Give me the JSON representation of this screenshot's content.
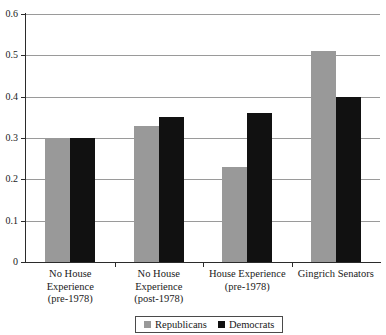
{
  "chart_data": {
    "type": "bar",
    "title": "",
    "subtitle": "",
    "xlabel": "",
    "ylabel": "",
    "ylim": [
      0,
      0.6
    ],
    "yticks": [
      "0",
      "0.1",
      "0.2",
      "0.3",
      "0.4",
      "0.5",
      "0.6"
    ],
    "ytick_values": [
      0,
      0.1,
      0.2,
      0.3,
      0.4,
      0.5,
      0.6
    ],
    "grid": "horizontal",
    "legend_position": "bottom-center",
    "categories": [
      "No House Experience (pre-1978)",
      "No House Experience (post-1978)",
      "House Experience (pre-1978)",
      "Gingrich Senators"
    ],
    "category_label_lines": [
      [
        "No House",
        "Experience",
        "(pre-1978)"
      ],
      [
        "No House",
        "Experience",
        "(post-1978)"
      ],
      [
        "House Experience",
        "(pre-1978)"
      ],
      [
        "Gingrich Senators"
      ]
    ],
    "series": [
      {
        "name": "Republicans",
        "color": "#999999",
        "values": [
          0.3,
          0.33,
          0.23,
          0.51
        ]
      },
      {
        "name": "Democrats",
        "color": "#111111",
        "values": [
          0.3,
          0.35,
          0.36,
          0.4
        ]
      }
    ]
  },
  "legend": {
    "items": [
      {
        "label": "Republicans",
        "swatch": "rep"
      },
      {
        "label": "Democrats",
        "swatch": "dem"
      }
    ]
  }
}
